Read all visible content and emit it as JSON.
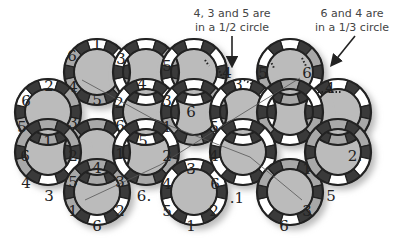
{
  "annotations": [
    {
      "line1": "4, 3 and 5 are",
      "line2": "in a 1/2 circle",
      "x": 232,
      "y": 7
    },
    {
      "line1": "6 and 4 are",
      "line2": "in a 1/3 circle",
      "x": 352,
      "y": 7
    }
  ],
  "colors": {
    "ring_stroke": "#222222",
    "dark_segment": "#3a3a3a",
    "grey_segment": "#a8a8a8",
    "white_segment": "#ffffff",
    "shadow": "#bbbbbb"
  },
  "tiles": [
    {
      "cx": 97,
      "cy": 72,
      "labels": [
        "1",
        "3",
        "2",
        "5",
        "4",
        "6"
      ],
      "fills": [
        "w",
        "w",
        "g",
        "g",
        "g",
        "g"
      ]
    },
    {
      "cx": 48,
      "cy": 112,
      "labels": [
        "2",
        "4",
        "3",
        "1",
        "5",
        "6"
      ],
      "fills": [
        "w",
        "g",
        "g",
        "g",
        "g",
        "w"
      ]
    },
    {
      "cx": 146,
      "cy": 72,
      "labels": [
        "",
        "4",
        "2",
        "3",
        "5",
        ""
      ],
      "fills": [
        "w",
        "g",
        "g",
        "w",
        "w",
        "w"
      ]
    },
    {
      "cx": 194,
      "cy": 72,
      "labels": [
        "",
        "",
        "3",
        "6",
        "3",
        "5"
      ],
      "fills": [
        "w",
        "w",
        "w",
        "w",
        "w",
        "w"
      ]
    },
    {
      "cx": 290,
      "cy": 72,
      "labels": [
        "",
        "",
        "4",
        "",
        "3",
        "5"
      ],
      "fills": [
        "w",
        "g",
        "w",
        "g",
        "g",
        "w"
      ]
    },
    {
      "cx": 338,
      "cy": 112,
      "labels": [
        "4",
        "",
        "",
        "",
        "",
        ""
      ],
      "fills": [
        "w",
        "w",
        "g",
        "g",
        "g",
        "w"
      ]
    },
    {
      "cx": 97,
      "cy": 152,
      "labels": [
        "5",
        "6",
        "5",
        "2",
        "1",
        ""
      ],
      "fills": [
        "g",
        "w",
        "w",
        "g",
        "g",
        "g"
      ]
    },
    {
      "cx": 48,
      "cy": 152,
      "labels": [
        "1",
        "2",
        "3",
        "4",
        "6",
        "5"
      ],
      "fills": [
        "g",
        "g",
        "w",
        "w",
        "g",
        "g"
      ]
    },
    {
      "cx": 146,
      "cy": 112,
      "labels": [
        "",
        "",
        "",
        "",
        "",
        ""
      ],
      "fills": [
        "w",
        "w",
        "w",
        "w",
        "w",
        "w"
      ]
    },
    {
      "cx": 194,
      "cy": 112,
      "labels": [
        "6",
        "5",
        "4",
        "2",
        "1",
        "3"
      ],
      "fills": [
        "w",
        "g",
        "g",
        "g",
        "g",
        "w"
      ]
    },
    {
      "cx": 243,
      "cy": 112,
      "labels": [
        "",
        "",
        "",
        "",
        "",
        ""
      ],
      "fills": [
        "w",
        "w",
        "w",
        "w",
        "w",
        "w"
      ]
    },
    {
      "cx": 290,
      "cy": 112,
      "labels": [
        "",
        "",
        "",
        "",
        "",
        ""
      ],
      "fills": [
        "g",
        "w",
        "g",
        "w",
        "g",
        "w"
      ]
    },
    {
      "cx": 97,
      "cy": 192,
      "labels": [
        "4",
        "3",
        "2",
        "6",
        "1",
        "5"
      ],
      "fills": [
        "g",
        "g",
        "w",
        "w",
        "g",
        "g"
      ]
    },
    {
      "cx": 146,
      "cy": 152,
      "labels": [
        "5",
        "",
        "6",
        "3",
        "",
        "1"
      ],
      "fills": [
        "w",
        "w",
        "g",
        "g",
        "w",
        "w"
      ]
    },
    {
      "cx": 194,
      "cy": 192,
      "labels": [
        "3",
        "6",
        "2",
        "1",
        "5",
        "4"
      ],
      "fills": [
        "w",
        "w",
        "w",
        "w",
        "w",
        "w"
      ]
    },
    {
      "cx": 243,
      "cy": 152,
      "labels": [
        "",
        "",
        "",
        "",
        "",
        ""
      ],
      "fills": [
        "w",
        "w",
        "w",
        "w",
        "w",
        "w"
      ]
    },
    {
      "cx": 290,
      "cy": 192,
      "labels": [
        "",
        "1",
        "3",
        "6",
        "",
        ""
      ],
      "fills": [
        "g",
        "g",
        "g",
        "w",
        "w",
        "g"
      ]
    },
    {
      "cx": 338,
      "cy": 152,
      "labels": [
        "",
        "2.",
        "",
        "5",
        "1",
        ""
      ],
      "fills": [
        "g",
        "g",
        "w",
        "w",
        "g",
        "g"
      ]
    }
  ],
  "segment_labels": [
    {
      "t": "1",
      "x": 97,
      "y": 43,
      "f": "w"
    },
    {
      "t": "6",
      "x": 72,
      "y": 55,
      "f": "g"
    },
    {
      "t": "3",
      "x": 121,
      "y": 58,
      "f": "w"
    },
    {
      "t": "2",
      "x": 49,
      "y": 85,
      "f": "w"
    },
    {
      "t": "4",
      "x": 73,
      "y": 86,
      "f": "g"
    },
    {
      "t": "4",
      "x": 142,
      "y": 83,
      "f": "g"
    },
    {
      "t": "5",
      "x": 167,
      "y": 65,
      "f": "w"
    },
    {
      "t": "6",
      "x": 26,
      "y": 100,
      "f": "w"
    },
    {
      "t": "5",
      "x": 97,
      "y": 99,
      "f": "g"
    },
    {
      "t": "2",
      "x": 119,
      "y": 102,
      "f": "g"
    },
    {
      "t": "3",
      "x": 167,
      "y": 100,
      "f": "w"
    },
    {
      "t": "5",
      "x": 22,
      "y": 126,
      "f": "g"
    },
    {
      "t": "3",
      "x": 73,
      "y": 122,
      "f": "g"
    },
    {
      "t": "6",
      "x": 120,
      "y": 125,
      "f": "w"
    },
    {
      "t": "6",
      "x": 191,
      "y": 111,
      "f": "w"
    },
    {
      "t": "1",
      "x": 167,
      "y": 126,
      "f": "g"
    },
    {
      "t": "5",
      "x": 214,
      "y": 126,
      "f": "g"
    },
    {
      "t": "1",
      "x": 48,
      "y": 140,
      "f": "g"
    },
    {
      "t": "5",
      "x": 143,
      "y": 140,
      "f": "w"
    },
    {
      "t": "6",
      "x": 25,
      "y": 155,
      "f": "g"
    },
    {
      "t": "2",
      "x": 73,
      "y": 155,
      "f": "g"
    },
    {
      "t": "1",
      "x": 120,
      "y": 153,
      "f": "w"
    },
    {
      "t": "2",
      "x": 167,
      "y": 155,
      "f": "g"
    },
    {
      "t": "4",
      "x": 214,
      "y": 155,
      "f": "g"
    },
    {
      "t": "4",
      "x": 97,
      "y": 167,
      "f": "g"
    },
    {
      "t": "3",
      "x": 191,
      "y": 168,
      "f": "w"
    },
    {
      "t": "4",
      "x": 26,
      "y": 182,
      "f": "w"
    },
    {
      "t": "5",
      "x": 73,
      "y": 181,
      "f": "g"
    },
    {
      "t": "3",
      "x": 120,
      "y": 181,
      "f": "g"
    },
    {
      "t": "4",
      "x": 167,
      "y": 183,
      "f": "w"
    },
    {
      "t": "6",
      "x": 215,
      "y": 183,
      "f": "w"
    },
    {
      "t": "3",
      "x": 49,
      "y": 195,
      "f": "w"
    },
    {
      "t": "6.",
      "x": 144,
      "y": 195,
      "f": "g"
    },
    {
      "t": ".1",
      "x": 237,
      "y": 197,
      "f": "g"
    },
    {
      "t": "1",
      "x": 307,
      "y": 168,
      "f": "g"
    },
    {
      "t": "2.",
      "x": 355,
      "y": 155,
      "f": "g"
    },
    {
      "t": "5",
      "x": 331,
      "y": 195,
      "f": "w"
    },
    {
      "t": "1",
      "x": 73,
      "y": 210,
      "f": "g"
    },
    {
      "t": "2",
      "x": 120,
      "y": 210,
      "f": "w"
    },
    {
      "t": "5",
      "x": 167,
      "y": 210,
      "f": "w"
    },
    {
      "t": "2",
      "x": 214,
      "y": 210,
      "f": "w"
    },
    {
      "t": "3",
      "x": 307,
      "y": 210,
      "f": "g"
    },
    {
      "t": "6",
      "x": 97,
      "y": 225,
      "f": "w"
    },
    {
      "t": "1",
      "x": 191,
      "y": 225,
      "f": "w"
    },
    {
      "t": "6",
      "x": 284,
      "y": 225,
      "f": "w"
    },
    {
      "t": "5",
      "x": 263,
      "y": 72,
      "f": "w"
    },
    {
      "t": "6",
      "x": 307,
      "y": 72,
      "f": "g"
    },
    {
      "t": "4",
      "x": 227,
      "y": 72,
      "f": "w"
    },
    {
      "t": "3",
      "x": 238,
      "y": 84,
      "f": "g"
    },
    {
      "t": "4",
      "x": 330,
      "y": 87,
      "f": "w"
    }
  ],
  "connector_lines": [
    {
      "x1": 82,
      "y1": 80,
      "x2": 155,
      "y2": 120
    },
    {
      "x1": 155,
      "y1": 120,
      "x2": 250,
      "y2": 157
    },
    {
      "x1": 250,
      "y1": 157,
      "x2": 302,
      "y2": 200
    },
    {
      "x1": 85,
      "y1": 200,
      "x2": 160,
      "y2": 165
    },
    {
      "x1": 160,
      "y1": 165,
      "x2": 240,
      "y2": 115
    },
    {
      "x1": 240,
      "y1": 115,
      "x2": 300,
      "y2": 78
    }
  ]
}
